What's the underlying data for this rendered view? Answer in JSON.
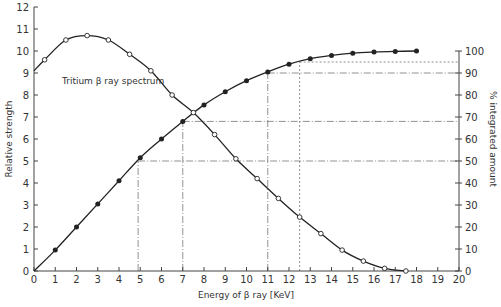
{
  "chart_data": {
    "type": "line",
    "title": "Tritium β ray spectrum",
    "annotation": "Tritium β ray spectrum",
    "xlabel": "Energy of β ray [KeV]",
    "ylabel": "Relative strength",
    "y2label": "% integrated amount",
    "xlim": [
      0,
      20
    ],
    "ylim": [
      0,
      12
    ],
    "y2lim": [
      0,
      120
    ],
    "xticks": [
      0,
      1,
      2,
      3,
      4,
      5,
      6,
      7,
      8,
      9,
      10,
      11,
      12,
      13,
      14,
      15,
      16,
      17,
      18,
      19,
      20
    ],
    "yticks": [
      0,
      1,
      2,
      3,
      4,
      5,
      6,
      7,
      8,
      9,
      10,
      11,
      12
    ],
    "y2ticks": [
      0,
      10,
      20,
      30,
      40,
      50,
      60,
      70,
      80,
      90,
      100
    ],
    "grid": false,
    "series": [
      {
        "name": "Relative strength (spectrum)",
        "axis": "left",
        "marker": "open-circle",
        "x": [
          0.5,
          1.5,
          2.5,
          3.5,
          4.5,
          5.5,
          6.5,
          7.5,
          8.5,
          9.5,
          10.5,
          11.5,
          12.5,
          13.5,
          14.5,
          15.5,
          16.5,
          17.5
        ],
        "values": [
          9.6,
          10.5,
          10.7,
          10.5,
          9.85,
          9.1,
          8.0,
          7.2,
          6.2,
          5.1,
          4.2,
          3.3,
          2.45,
          1.7,
          0.95,
          0.45,
          0.12,
          0.0
        ]
      },
      {
        "name": "% integrated amount",
        "axis": "right",
        "marker": "filled-circle",
        "x": [
          1,
          2,
          3,
          4,
          5,
          6,
          7,
          8,
          9,
          10,
          11,
          12,
          13,
          14,
          15,
          16,
          17,
          18
        ],
        "values": [
          9.5,
          20,
          30.5,
          41,
          51.5,
          60,
          68,
          75.5,
          81.5,
          86.5,
          90.5,
          94,
          96.5,
          98,
          99,
          99.5,
          99.8,
          100
        ]
      }
    ],
    "reference_lines": [
      {
        "x": 4.9,
        "y2": 50,
        "style": "dash-dot"
      },
      {
        "x": 7.0,
        "y2": 68,
        "style": "dash-dot"
      },
      {
        "x": 11.0,
        "y2": 90,
        "style": "dash-dot"
      },
      {
        "x": 12.5,
        "y2": 95,
        "style": "dotted"
      }
    ],
    "colors": {
      "line": "#222222",
      "axis": "#444444",
      "reference": "#777777"
    }
  }
}
